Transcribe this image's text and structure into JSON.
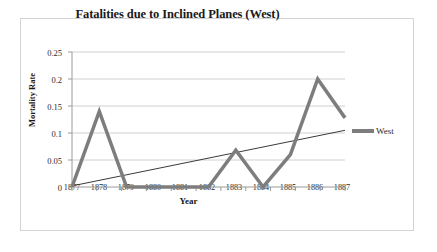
{
  "chart_data": {
    "type": "line",
    "title": "Fatalities due to Inclined Planes (West)",
    "xlabel": "Year",
    "ylabel": "Mortality Rate",
    "x": [
      1877,
      1878,
      1879,
      1880,
      1881,
      1882,
      1883,
      1884,
      1885,
      1886,
      1887
    ],
    "xtick_labels": [
      "1877",
      "1878",
      "1879",
      "1880",
      "1881",
      "1882",
      "1883",
      "1884",
      "1885",
      "1886",
      "1887"
    ],
    "ytick_labels": [
      "0",
      "0.05",
      "0.1",
      "0.15",
      "0.2",
      "0.25"
    ],
    "ytick_values": [
      0,
      0.05,
      0.1,
      0.15,
      0.2,
      0.25
    ],
    "ylim": [
      0,
      0.25
    ],
    "xlim": [
      1877,
      1887
    ],
    "grid": "horizontal",
    "legend_position": "right",
    "series": [
      {
        "name": "West",
        "values": [
          0,
          0.14,
          0,
          0,
          0,
          0,
          0.068,
          0,
          0.06,
          0.2,
          0.128
        ],
        "color": "#7d7d7d",
        "width": 3.5
      }
    ],
    "trendline": {
      "name": "linear-trend",
      "start": [
        1877,
        0.002
      ],
      "end": [
        1887,
        0.105
      ],
      "color": "#3a3a3a",
      "width": 1
    },
    "colors": {
      "series": "#7d7d7d",
      "trendline": "#3a3a3a",
      "gridline": "#d0d0d0",
      "axis": "#9a9a9a",
      "frame": "#d4d4d4",
      "text": "#2b2b2b",
      "title": "#1a1a1a",
      "background": "#ffffff"
    }
  },
  "legend": {
    "entries": [
      {
        "label": "West"
      }
    ]
  }
}
